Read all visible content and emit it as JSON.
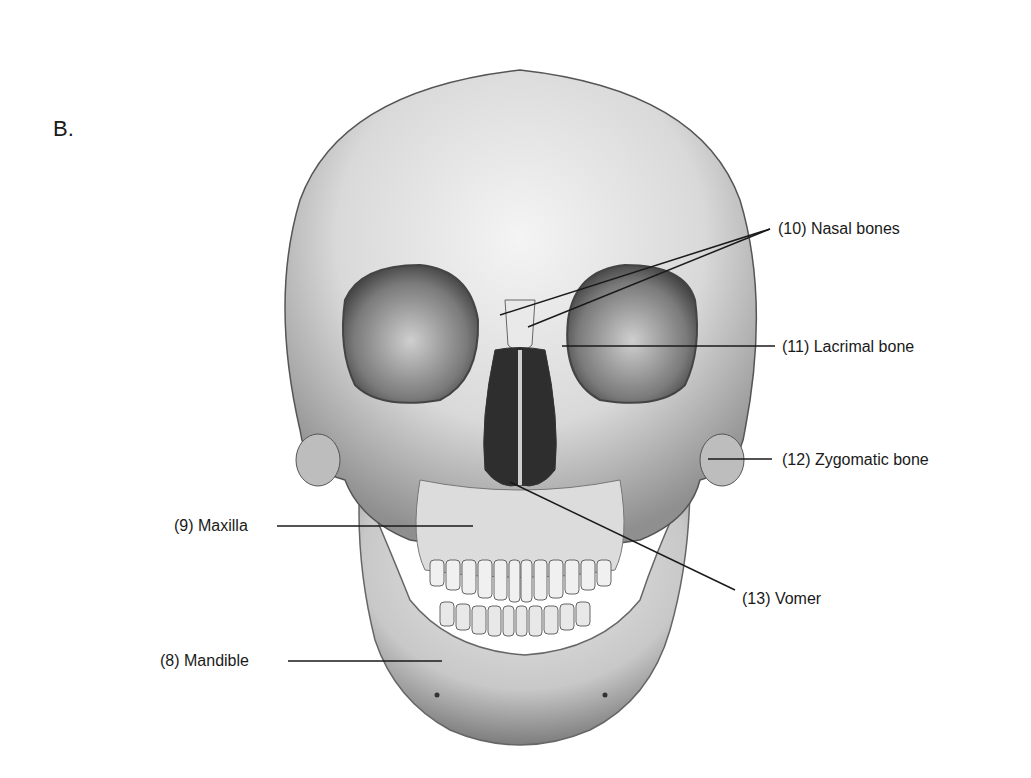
{
  "figure": {
    "panel_letter": "B.",
    "labels": [
      {
        "id": "nasal",
        "text": "(10) Nasal bones"
      },
      {
        "id": "lacrimal",
        "text": "(11) Lacrimal bone"
      },
      {
        "id": "zygomatic",
        "text": "(12) Zygomatic bone"
      },
      {
        "id": "maxilla",
        "text": "(9) Maxilla"
      },
      {
        "id": "vomer",
        "text": "(13) Vomer"
      },
      {
        "id": "mandible",
        "text": "(8) Mandible"
      }
    ]
  }
}
